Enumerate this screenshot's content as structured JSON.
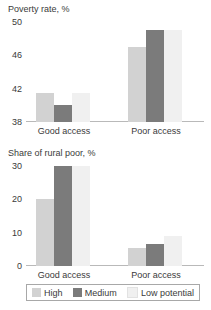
{
  "chart_data": [
    {
      "type": "bar",
      "title": "Poverty rate, %",
      "xlabel": "",
      "ylabel": "",
      "categories": [
        "Good access",
        "Poor access"
      ],
      "ylim": [
        38,
        50
      ],
      "yticks": [
        38,
        42,
        46,
        50
      ],
      "ytick_labels": [
        "38",
        "42",
        "46",
        "50"
      ],
      "grid": false,
      "legend_position": "bottom",
      "series": [
        {
          "name": "High",
          "color": "#d2d2d2",
          "values": [
            41.5,
            47.0
          ]
        },
        {
          "name": "Medium",
          "color": "#7b7b7b",
          "values": [
            40.0,
            49.0
          ]
        },
        {
          "name": "Low potential",
          "color": "#f0f0f0",
          "values": [
            41.5,
            49.0
          ]
        }
      ]
    },
    {
      "type": "bar",
      "title": "Share of rural poor, %",
      "xlabel": "",
      "ylabel": "",
      "categories": [
        "Good access",
        "Poor access"
      ],
      "ylim": [
        0,
        30
      ],
      "yticks": [
        0,
        10,
        20,
        30
      ],
      "ytick_labels": [
        "0",
        "10",
        "20",
        "30"
      ],
      "grid": false,
      "legend_position": "bottom",
      "series": [
        {
          "name": "High",
          "color": "#d2d2d2",
          "values": [
            20.0,
            5.5
          ]
        },
        {
          "name": "Medium",
          "color": "#7b7b7b",
          "values": [
            30.0,
            6.5
          ]
        },
        {
          "name": "Low potential",
          "color": "#f0f0f0",
          "values": [
            30.0,
            9.0
          ]
        }
      ]
    }
  ],
  "legend": {
    "items": [
      {
        "label": "High",
        "color": "#d2d2d2"
      },
      {
        "label": "Medium",
        "color": "#7b7b7b"
      },
      {
        "label": "Low potential",
        "color": "#f0f0f0"
      }
    ]
  },
  "colors": {
    "high": "#d2d2d2",
    "medium": "#7b7b7b",
    "low": "#f0f0f0",
    "text": "#3a3a3a",
    "axis": "#b9b9b9",
    "background": "#ffffff"
  }
}
